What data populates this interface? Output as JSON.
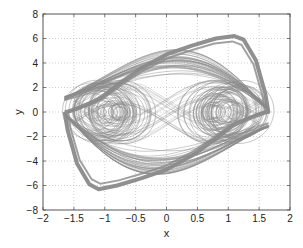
{
  "chart_data": {
    "type": "line",
    "title": "",
    "xlabel": "x",
    "ylabel": "y",
    "xlim": [
      -2,
      2
    ],
    "ylim": [
      -8,
      8
    ],
    "xticks": [
      -2,
      -1.5,
      -1,
      -0.5,
      0,
      0.5,
      1,
      1.5,
      2
    ],
    "yticks": [
      -8,
      -6,
      -4,
      -2,
      0,
      2,
      4,
      6,
      8
    ],
    "xtick_labels": [
      "−2",
      "−1.5",
      "−1",
      "−0.5",
      "0",
      "0.5",
      "1",
      "1.5",
      "2"
    ],
    "ytick_labels": [
      "−8",
      "−6",
      "−4",
      "−2",
      "0",
      "2",
      "4",
      "6",
      "8"
    ],
    "grid": true,
    "grid_style": "dotted",
    "legend": null,
    "line_color": "#8a8a8a",
    "series": [
      {
        "name": "attractor envelope",
        "x": [
          -1.65,
          -1.6,
          -1.45,
          -1.25,
          -1.1,
          -0.8,
          -0.4,
          0.0,
          0.4,
          0.8,
          1.05,
          1.2,
          1.35,
          1.5,
          1.62,
          1.65,
          1.6,
          1.45,
          1.25,
          1.1,
          0.8,
          0.4,
          0.0,
          -0.4,
          -0.8,
          -1.05,
          -1.2,
          -1.35,
          -1.5,
          -1.62,
          -1.65
        ],
        "y": [
          0.0,
          -1.5,
          -4.2,
          -5.9,
          -6.3,
          -6.0,
          -5.4,
          -4.7,
          -3.6,
          -2.2,
          -1.2,
          -0.8,
          -0.5,
          -0.2,
          0.0,
          0.0,
          1.5,
          4.2,
          5.9,
          6.2,
          6.0,
          5.4,
          4.7,
          3.6,
          2.2,
          1.2,
          0.8,
          0.5,
          0.2,
          0.0,
          0.0
        ]
      },
      {
        "name": "left scroll",
        "center": [
          -0.95,
          0.0
        ],
        "x_radius_range": [
          0.1,
          0.55
        ],
        "y_radius_range": [
          0.4,
          2.6
        ]
      },
      {
        "name": "right scroll",
        "center": [
          0.95,
          0.0
        ],
        "x_radius_range": [
          0.1,
          0.55
        ],
        "y_radius_range": [
          0.4,
          2.6
        ]
      }
    ]
  },
  "axes": {
    "plot_left_px": 43,
    "plot_right_px": 290,
    "plot_top_px": 14,
    "plot_bottom_px": 210
  }
}
